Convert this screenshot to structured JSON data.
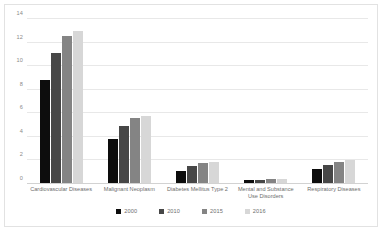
{
  "chart_data": {
    "type": "bar",
    "title": "",
    "xlabel": "",
    "ylabel": "",
    "ylim": [
      0,
      14
    ],
    "yticks": [
      0,
      2,
      4,
      6,
      8,
      10,
      12,
      14
    ],
    "grid": true,
    "legend_position": "bottom",
    "categories": [
      "Cardiovascular Diseases",
      "Malignant Neoplasm",
      "Diabetes Mellitus Type 2",
      "Mental and Substance Use Disorders",
      "Respiratory Diseases"
    ],
    "series": [
      {
        "name": "2000",
        "color": "#0d0d0d",
        "values": [
          8.8,
          3.8,
          1.1,
          0.3,
          1.3
        ]
      },
      {
        "name": "2010",
        "color": "#474747",
        "values": [
          11.1,
          4.9,
          1.5,
          0.35,
          1.6
        ]
      },
      {
        "name": "2015",
        "color": "#848484",
        "values": [
          12.6,
          5.6,
          1.8,
          0.4,
          1.9
        ]
      },
      {
        "name": "2016",
        "color": "#d7d7d7",
        "values": [
          13.0,
          5.8,
          1.9,
          0.4,
          2.0
        ]
      }
    ]
  }
}
